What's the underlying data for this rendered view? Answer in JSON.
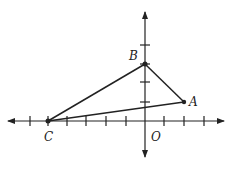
{
  "diagram": {
    "type": "coordinate-plane-triangle",
    "points": {
      "A": {
        "label": "A",
        "x": 2,
        "y": 1
      },
      "B": {
        "label": "B",
        "x": 0,
        "y": 3
      },
      "C": {
        "label": "C",
        "x": -5,
        "y": 0
      }
    },
    "origin_label": "O",
    "axis_color": "#222222",
    "line_color": "#222222"
  }
}
